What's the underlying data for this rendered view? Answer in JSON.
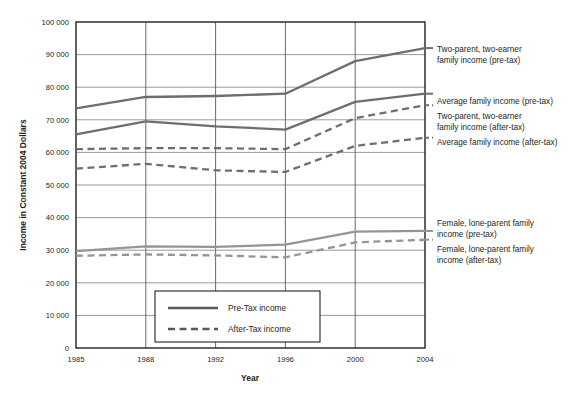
{
  "chart_data": {
    "type": "line",
    "title": "",
    "xlabel": "Year",
    "ylabel": "Income in Constant 2004 Dollars",
    "categories": [
      "1985",
      "1988",
      "1992",
      "1996",
      "2000",
      "2004"
    ],
    "x_tick_labels": [
      "1985",
      "1988",
      "1992",
      "1996",
      "2000",
      "2004"
    ],
    "y_tick_labels": [
      "0",
      "10 000",
      "20 000",
      "30 000",
      "40 000",
      "50 000",
      "60 000",
      "70 000",
      "80 000",
      "90 000",
      "100 000"
    ],
    "y_tick_values": [
      0,
      10000,
      20000,
      30000,
      40000,
      50000,
      60000,
      70000,
      80000,
      90000,
      100000
    ],
    "ylim": [
      0,
      100000
    ],
    "grid": true,
    "legend_position": "inside-bottom-center",
    "series": [
      {
        "name": "Two-parent, two-earner family income (pre-tax)",
        "style": "solid",
        "color": "#6d6e71",
        "values": [
          73500,
          77000,
          77300,
          78000,
          88000,
          92000
        ],
        "annotation": [
          "Two-parent, two-earner",
          "family income (pre-tax)"
        ],
        "annotation_y": 52
      },
      {
        "name": "Average family income (pre-tax)",
        "style": "solid",
        "color": "#6d6e71",
        "values": [
          65500,
          69500,
          68000,
          67000,
          75500,
          78000
        ],
        "annotation": [
          "Average family income (pre-tax)"
        ],
        "annotation_y": 104
      },
      {
        "name": "Two-parent, two-earner family income (after-tax)",
        "style": "dashed",
        "color": "#6d6e71",
        "values": [
          61000,
          61300,
          61300,
          61000,
          70500,
          74500
        ],
        "annotation": [
          "Two-parent, two-earner",
          "family income (after-tax)"
        ],
        "annotation_y": 119
      },
      {
        "name": "Average family income (after-tax)",
        "style": "dashed",
        "color": "#6d6e71",
        "values": [
          55000,
          56500,
          54500,
          54000,
          62000,
          64500
        ],
        "annotation": [
          "Average family income (after-tax)"
        ],
        "annotation_y": 145
      },
      {
        "name": "Female, lone-parent family income (pre-tax)",
        "style": "solid",
        "color": "#939598",
        "values": [
          29700,
          31200,
          31000,
          31700,
          35700,
          35900
        ],
        "annotation": [
          "Female, lone-parent family",
          "income (pre-tax)"
        ],
        "annotation_y": 226
      },
      {
        "name": "Female, lone-parent family income (after-tax)",
        "style": "dashed",
        "color": "#939598",
        "values": [
          28300,
          28700,
          28400,
          27800,
          32400,
          33200
        ],
        "annotation": [
          "Female, lone-parent family",
          "income (after-tax)"
        ],
        "annotation_y": 252
      }
    ],
    "legend": {
      "items": [
        {
          "label": "Pre-Tax income",
          "style": "solid"
        },
        {
          "label": "After-Tax income",
          "style": "dashed"
        }
      ]
    }
  }
}
